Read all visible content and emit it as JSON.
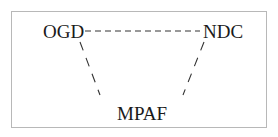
{
  "diagram": {
    "nodes": [
      {
        "id": "ogd",
        "label": "OGD"
      },
      {
        "id": "ndc",
        "label": "NDC"
      },
      {
        "id": "mpaf",
        "label": "MPAF"
      }
    ],
    "edges": [
      {
        "from": "OGD",
        "to": "NDC",
        "style": "dashed"
      },
      {
        "from": "OGD",
        "to": "MPAF",
        "style": "dashed"
      },
      {
        "from": "NDC",
        "to": "MPAF",
        "style": "dashed"
      }
    ],
    "colors": {
      "text": "#1a1a1a",
      "border": "#b8b8b8",
      "line": "#333333"
    }
  }
}
